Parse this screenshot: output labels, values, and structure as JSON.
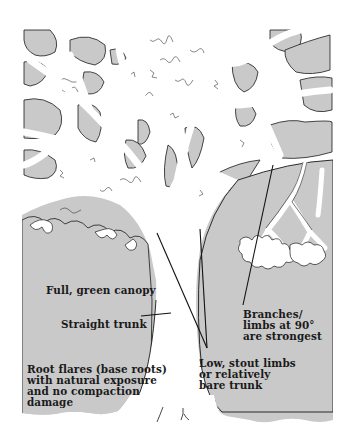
{
  "figure": {
    "colors": {
      "background": "#ffffff",
      "shaded_fill": "#c9c9c9",
      "outline": "#1a1a1a",
      "leader_line": "#111111"
    }
  },
  "labels": {
    "canopy": "Full, green canopy",
    "trunk": "Straight trunk",
    "branches": [
      "Branches/",
      "limbs at 90°",
      "are strongest"
    ],
    "limbs": [
      "Low, stout limbs",
      "or relatively",
      "bare trunk"
    ],
    "roots": [
      "Root flares (base roots)",
      "with natural exposure",
      "and no compaction",
      "damage"
    ]
  }
}
